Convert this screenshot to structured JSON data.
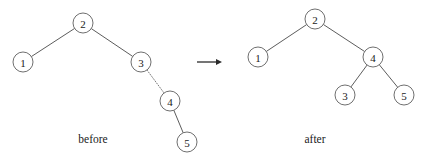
{
  "figure": {
    "background_color": "#ffffff",
    "line_color": "#4a4a4a",
    "node_stroke_color": "#555555",
    "node_fill_color": "#ffffff",
    "text_color": "#1a1a1a",
    "arrow_color": "#2b2b2b",
    "transition_arrow": {
      "name": "transition-arrow",
      "x1": 197,
      "y1": 62,
      "x2": 222,
      "y2": 62
    },
    "trees": [
      {
        "id": "before",
        "caption": "before",
        "caption_x": 93,
        "caption_y": 143,
        "node_radius": 10,
        "nodes": [
          {
            "id": "b1",
            "label": "1",
            "cx": 23,
            "cy": 62
          },
          {
            "id": "b2",
            "label": "2",
            "cx": 83,
            "cy": 23
          },
          {
            "id": "b3",
            "label": "3",
            "cx": 141,
            "cy": 62
          },
          {
            "id": "b4",
            "label": "4",
            "cx": 170,
            "cy": 101
          },
          {
            "id": "b5",
            "label": "5",
            "cx": 187,
            "cy": 142
          }
        ],
        "edges": [
          {
            "id": "b2-b1",
            "from": "b2",
            "to": "b1",
            "style": "solid"
          },
          {
            "id": "b2-b3",
            "from": "b2",
            "to": "b3",
            "style": "solid"
          },
          {
            "id": "b3-b4",
            "from": "b3",
            "to": "b4",
            "style": "dotted"
          },
          {
            "id": "b4-b5",
            "from": "b4",
            "to": "b5",
            "style": "solid"
          }
        ]
      },
      {
        "id": "after",
        "caption": "after",
        "caption_x": 315,
        "caption_y": 143,
        "node_radius": 10,
        "nodes": [
          {
            "id": "a1",
            "label": "1",
            "cx": 258,
            "cy": 57
          },
          {
            "id": "a2",
            "label": "2",
            "cx": 315,
            "cy": 19
          },
          {
            "id": "a4",
            "label": "4",
            "cx": 373,
            "cy": 57
          },
          {
            "id": "a3",
            "label": "3",
            "cx": 345,
            "cy": 95
          },
          {
            "id": "a5",
            "label": "5",
            "cx": 404,
            "cy": 95
          }
        ],
        "edges": [
          {
            "id": "a2-a1",
            "from": "a2",
            "to": "a1",
            "style": "solid"
          },
          {
            "id": "a2-a4",
            "from": "a2",
            "to": "a4",
            "style": "solid"
          },
          {
            "id": "a4-a3",
            "from": "a4",
            "to": "a3",
            "style": "solid"
          },
          {
            "id": "a4-a5",
            "from": "a4",
            "to": "a5",
            "style": "solid"
          }
        ]
      }
    ]
  }
}
